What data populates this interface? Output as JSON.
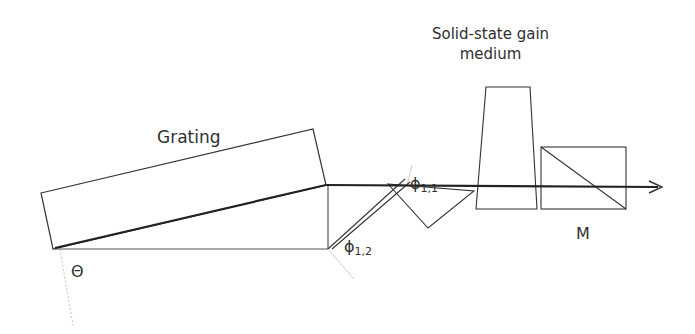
{
  "diagram": {
    "labels": {
      "grating": "Grating",
      "gain_medium_line1": "Solid-state gain",
      "gain_medium_line2": "medium",
      "theta": "Θ",
      "phi11_symbol": "ϕ",
      "phi11_sub": "1,1",
      "phi12_symbol": "ϕ",
      "phi12_sub": "1,2",
      "mirror": "M"
    },
    "colors": {
      "line": "#333333",
      "beam": "#222222",
      "guide": "#b5b5b5"
    },
    "components": [
      "grating",
      "prism",
      "gain-medium",
      "mirror-M",
      "output-beam"
    ]
  }
}
